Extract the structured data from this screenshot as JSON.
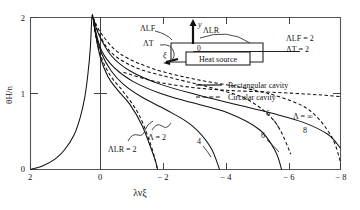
{
  "figure": {
    "ylabel": "θH/n",
    "xlabel": "λνξ"
  },
  "axes": {
    "x_ticks": [
      "2",
      "0",
      "− 2",
      "− 4",
      "− 6",
      "− 8"
    ],
    "y_ticks": [
      "0",
      "1",
      "2"
    ]
  },
  "legend": {
    "items": [
      {
        "label": "Rectangular cavity",
        "style": "solid"
      },
      {
        "label": "Circular cavity",
        "style": "dashed"
      }
    ]
  },
  "parameters": [
    {
      "label": "ΛLF = 2"
    },
    {
      "label": "ΛT  = 2"
    }
  ],
  "inset": {
    "label_lf": "ΛLF",
    "label_lr": "ΛLR",
    "label_t": "ΛT",
    "label_xi": "ξ",
    "label_y": "y",
    "label_origin": "0",
    "label_source": "Heat source"
  },
  "annotations": [
    {
      "name": "lambda-lr-2",
      "text": "ΛLR = 2"
    },
    {
      "name": "lambda-2",
      "text": "Λ = 2"
    },
    {
      "name": "lambda-inf",
      "text": "Λ = ∞"
    },
    {
      "name": "curve-4",
      "text": "4"
    },
    {
      "name": "curve-6a",
      "text": "6"
    },
    {
      "name": "curve-6b",
      "text": "6"
    },
    {
      "name": "curve-8",
      "text": "8"
    }
  ],
  "chart_data": {
    "type": "line",
    "title": "",
    "xlabel": "λνξ",
    "ylabel": "θH/n",
    "xlim": [
      2,
      -8
    ],
    "ylim": [
      0,
      2
    ],
    "grid": false,
    "legend_position": "top-right",
    "legend": [
      "Rectangular cavity",
      "Circular cavity"
    ],
    "fixed_parameters": {
      "Lambda_LF": 2,
      "Lambda_T": 2,
      "Lambda_LR": 2
    },
    "series": [
      {
        "name": "Λ = 2 (rectangular)",
        "style": "solid",
        "label": "Λ = 2",
        "x": [
          2.0,
          1.6,
          1.2,
          0.9,
          0.6,
          0.4,
          0.25,
          0.15,
          0.07,
          0.02,
          -0.02,
          -0.1,
          -0.25,
          -0.5,
          -0.8,
          -1.2,
          -1.6,
          -2.0,
          -2.1
        ],
        "y": [
          0.0,
          0.05,
          0.14,
          0.26,
          0.45,
          0.68,
          0.95,
          1.25,
          1.6,
          2.0,
          2.0,
          1.78,
          1.48,
          1.22,
          1.05,
          0.86,
          0.58,
          0.15,
          0.0
        ]
      },
      {
        "name": "Λ = 4 (rectangular)",
        "style": "solid",
        "label": "4",
        "x": [
          -0.02,
          -0.1,
          -0.3,
          -0.6,
          -1.0,
          -1.6,
          -2.4,
          -3.2,
          -3.8,
          -4.1
        ],
        "y": [
          2.0,
          1.8,
          1.52,
          1.3,
          1.12,
          0.95,
          0.78,
          0.58,
          0.3,
          0.0
        ]
      },
      {
        "name": "Λ = 6 (rectangular)",
        "style": "solid",
        "label": "6",
        "x": [
          -0.02,
          -0.1,
          -0.3,
          -0.7,
          -1.3,
          -2.2,
          -3.2,
          -4.4,
          -5.4,
          -5.9,
          -6.1
        ],
        "y": [
          2.0,
          1.82,
          1.56,
          1.34,
          1.16,
          1.0,
          0.88,
          0.74,
          0.52,
          0.24,
          0.0
        ]
      },
      {
        "name": "Λ = ∞ (rectangular)",
        "style": "solid",
        "label": "Λ = ∞",
        "x": [
          -0.02,
          -0.2,
          -0.6,
          -1.2,
          -2.2,
          -3.4,
          -4.6,
          -5.8,
          -6.8,
          -7.6,
          -8.0
        ],
        "y": [
          2.0,
          1.78,
          1.5,
          1.3,
          1.12,
          0.98,
          0.86,
          0.74,
          0.62,
          0.46,
          0.28
        ]
      },
      {
        "name": "Λ = 2 (circular)",
        "style": "dashed",
        "label": "",
        "x": [
          -0.02,
          -0.1,
          -0.3,
          -0.6,
          -1.0,
          -1.5,
          -1.9,
          -2.1
        ],
        "y": [
          2.0,
          1.76,
          1.46,
          1.22,
          1.02,
          0.72,
          0.3,
          0.0
        ]
      },
      {
        "name": "Λ = 6 (circular)",
        "style": "dashed",
        "label": "6",
        "x": [
          -0.02,
          -0.2,
          -0.6,
          -1.4,
          -2.6,
          -3.8,
          -5.0,
          -5.9,
          -6.4
        ],
        "y": [
          2.0,
          1.8,
          1.54,
          1.34,
          1.2,
          1.08,
          0.92,
          0.62,
          0.2
        ]
      },
      {
        "name": "Λ = 8 (circular)",
        "style": "dashed",
        "label": "8",
        "x": [
          -0.02,
          -0.3,
          -0.9,
          -2.0,
          -3.4,
          -4.8,
          -6.0,
          -7.0,
          -7.7,
          -8.0
        ],
        "y": [
          2.0,
          1.78,
          1.52,
          1.32,
          1.18,
          1.08,
          0.96,
          0.78,
          0.44,
          0.1
        ]
      },
      {
        "name": "Λ = ∞ (circular)",
        "style": "dashed",
        "label": "",
        "x": [
          -1.0,
          -2.0,
          -3.2,
          -4.4,
          -5.6,
          -6.6,
          -7.4,
          -8.0
        ],
        "y": [
          1.28,
          1.16,
          1.08,
          1.04,
          1.02,
          1.0,
          0.98,
          0.96
        ]
      }
    ]
  }
}
